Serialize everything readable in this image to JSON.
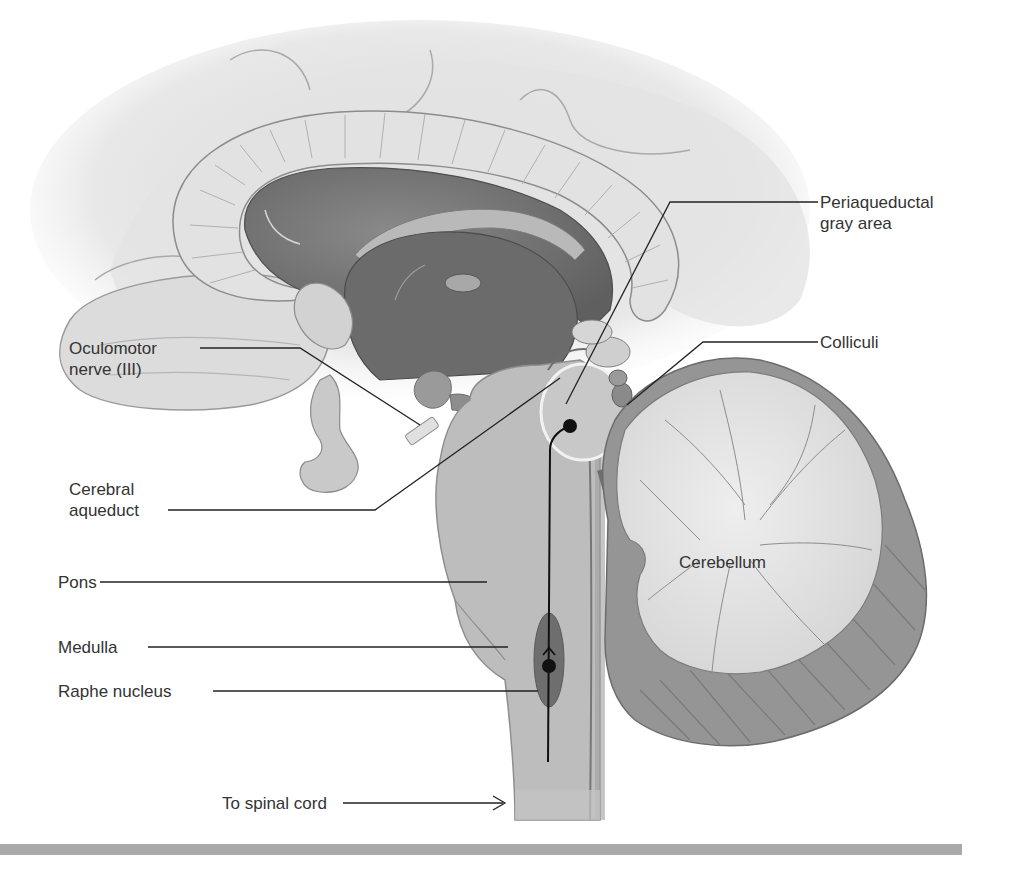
{
  "figure": {
    "colors": {
      "background": "#ffffff",
      "cortex_light": "#e6e6e6",
      "corpus_callosum": "#dcdcdc",
      "ventricle_dark": "#7a7a7a",
      "brainstem": "#bdbdbd",
      "raphe_nucleus": "#6e6e6e",
      "cerebellum_white": "#e4e4e4",
      "cerebellum_gray": "#8f8f8f",
      "pathway_line": "#111111",
      "label_text": "#333333",
      "bottom_rule": "#a9a9a9"
    }
  },
  "labels": {
    "periaqueductal": {
      "line1": "Periaqueductal",
      "line2": "gray area"
    },
    "colliculi": {
      "text": "Colliculi"
    },
    "oculomotor": {
      "line1": "Oculomotor",
      "line2": "nerve (III)"
    },
    "cerebral_aqueduct": {
      "line1": "Cerebral",
      "line2": "aqueduct"
    },
    "pons": {
      "text": "Pons"
    },
    "medulla": {
      "text": "Medulla"
    },
    "raphe": {
      "text": "Raphe nucleus"
    },
    "cerebellum": {
      "text": "Cerebellum"
    },
    "spinal_cord": {
      "text": "To spinal cord"
    }
  }
}
